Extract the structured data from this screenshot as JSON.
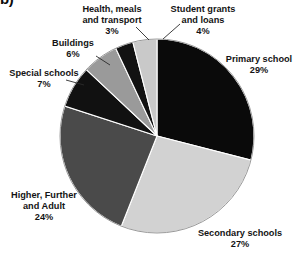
{
  "figure": {
    "letter": "b)",
    "background_color": "#ffffff",
    "text_color": "#141414"
  },
  "chart_data": {
    "type": "pie",
    "title": "",
    "subtitle": "",
    "xlabel": "",
    "ylabel": "",
    "units": "percent",
    "total": 100,
    "start_angle_deg": 0,
    "direction": "clockwise",
    "center": {
      "x": 157,
      "y": 136
    },
    "radius": 97,
    "legend": "none",
    "grid": false,
    "labels_outside": true,
    "leader_lines": true,
    "categories": [
      "Primary school",
      "Secondary schools",
      "Higher, Further and Adult",
      "Special schools",
      "Buildings",
      "Health, meals and transport",
      "Student grants and loans"
    ],
    "values": [
      29,
      27,
      24,
      7,
      6,
      3,
      4
    ],
    "colors": [
      "#0a0a0a",
      "#d2d2d2",
      "#4a4a4a",
      "#111111",
      "#9a9a9a",
      "#121212",
      "#c9c9c9"
    ],
    "slices": [
      {
        "label": "Primary school",
        "value": 29,
        "value_text": "29%",
        "color": "#0a0a0a",
        "start_deg": 0,
        "end_deg": 104.4
      },
      {
        "label": "Secondary schools",
        "value": 27,
        "value_text": "27%",
        "color": "#d2d2d2",
        "start_deg": 104.4,
        "end_deg": 201.6
      },
      {
        "label": "Higher, Further and Adult",
        "value": 24,
        "value_text": "24%",
        "color": "#4a4a4a",
        "start_deg": 201.6,
        "end_deg": 288.0
      },
      {
        "label": "Special schools",
        "value": 7,
        "value_text": "7%",
        "color": "#111111",
        "start_deg": 288.0,
        "end_deg": 313.2
      },
      {
        "label": "Buildings",
        "value": 6,
        "value_text": "6%",
        "color": "#9a9a9a",
        "start_deg": 313.2,
        "end_deg": 334.8
      },
      {
        "label": "Health, meals and transport",
        "value": 3,
        "value_text": "3%",
        "color": "#121212",
        "start_deg": 334.8,
        "end_deg": 345.6
      },
      {
        "label": "Student grants and loans",
        "value": 4,
        "value_text": "4%",
        "color": "#c9c9c9",
        "start_deg": 345.6,
        "end_deg": 360.0
      }
    ]
  },
  "callouts": {
    "primary": {
      "line1": "Primary school",
      "line2": "",
      "value": "29%"
    },
    "secondary": {
      "line1": "Secondary schools",
      "line2": "",
      "value": "27%"
    },
    "higher": {
      "line1": "Higher, Further",
      "line2": "and Adult",
      "value": "24%"
    },
    "special": {
      "line1": "Special schools",
      "line2": "",
      "value": "7%"
    },
    "buildings": {
      "line1": "Buildings",
      "line2": "",
      "value": "6%"
    },
    "health": {
      "line1": "Health, meals",
      "line2": "and transport",
      "value": "3%"
    },
    "grants": {
      "line1": "Student grants",
      "line2": "and loans",
      "value": "4%"
    }
  }
}
